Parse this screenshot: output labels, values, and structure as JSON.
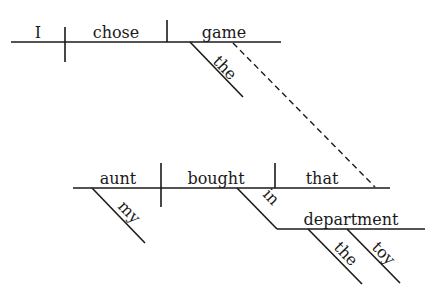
{
  "diagram": {
    "type": "sentence-diagram",
    "top_clause": {
      "subject": "I",
      "verb": "chose",
      "object": "game",
      "object_modifiers": [
        "the"
      ]
    },
    "relative_clause": {
      "subject": "aunt",
      "subject_modifiers": [
        "my"
      ],
      "verb": "bought",
      "object": "that",
      "prepositional_phrase": {
        "preposition": "in",
        "object": "department",
        "object_modifiers": [
          "the",
          "toy"
        ]
      }
    },
    "connector": "dashed line from game to that"
  },
  "colors": {
    "ink": "#1a1a1a",
    "background": "#ffffff"
  }
}
